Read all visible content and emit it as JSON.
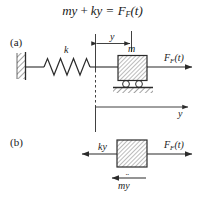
{
  "figure": {
    "equation": {
      "lhs_mass": "m",
      "lhs_accel": "y",
      "plus": "+",
      "stiffness": "k",
      "displacement": "y",
      "equals": "=",
      "force_symbol": "F",
      "force_subscript": "F",
      "force_arg": "(t)",
      "full_text": "mÿ + ky = F_F(t)"
    },
    "panels": [
      {
        "tag": "(a)",
        "name": "physical-model",
        "labels": {
          "spring_stiffness": "k",
          "mass": "m",
          "applied_force": "F",
          "applied_force_subscript": "F",
          "applied_force_arg": "(t)",
          "displacement_dimension": "y",
          "axis": "y"
        },
        "elements": {
          "wall": "hatched-fixed-support",
          "spring": "coil-spring",
          "mass_block": "hatched-square-mass",
          "rollers": 2,
          "ground": "hatched-ground-line",
          "datum_line": "dashed-reference-line"
        }
      },
      {
        "tag": "(b)",
        "name": "free-body-diagram",
        "labels": {
          "spring_force": "ky",
          "inertia_force_mass": "m",
          "inertia_force_accel": "y",
          "applied_force": "F",
          "applied_force_subscript": "F",
          "applied_force_arg": "(t)"
        },
        "elements": {
          "mass_block": "hatched-square-mass",
          "force_left": "ky",
          "force_right": "F_F(t)",
          "inertia_arrow": "mÿ"
        }
      }
    ],
    "colors": {
      "ink": "#1a1a1a",
      "line": "#2b2b2b",
      "hatch": "#555555",
      "background": "#ffffff"
    }
  }
}
